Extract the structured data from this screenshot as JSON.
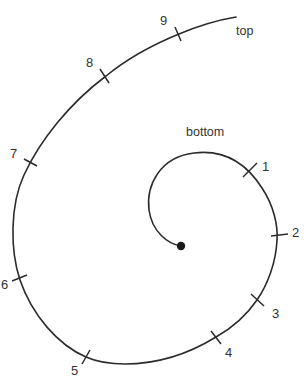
{
  "diagram": {
    "type": "spiral",
    "labels": {
      "top": "top",
      "bottom": "bottom"
    },
    "colors": {
      "line": "#2b2b2b",
      "text": "#333333",
      "background": "#ffffff"
    },
    "ticks": [
      {
        "label": "1"
      },
      {
        "label": "2"
      },
      {
        "label": "3"
      },
      {
        "label": "4"
      },
      {
        "label": "5"
      },
      {
        "label": "6"
      },
      {
        "label": "7"
      },
      {
        "label": "8"
      },
      {
        "label": "9"
      }
    ]
  }
}
